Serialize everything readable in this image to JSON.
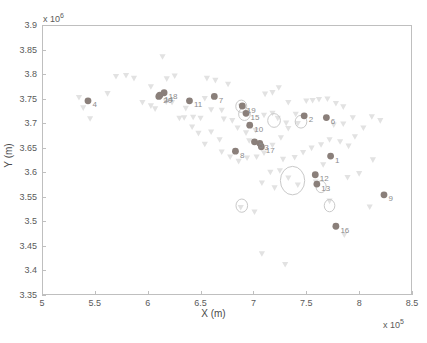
{
  "chart_data": {
    "type": "scatter",
    "title": "",
    "xlabel": "X (m)",
    "ylabel": "Y (m)",
    "x_exponent": "x 10",
    "x_exponent_power": "5",
    "y_exponent": "x 10",
    "y_exponent_power": "6",
    "xlim": [
      5.0,
      8.5
    ],
    "ylim": [
      3.35,
      3.9
    ],
    "xticks": [
      "5",
      "5.5",
      "6",
      "6.5",
      "7",
      "7.5",
      "8",
      "8.5"
    ],
    "xtick_values": [
      5.0,
      5.5,
      6.0,
      6.5,
      7.0,
      7.5,
      8.0,
      8.5
    ],
    "yticks": [
      "3.9",
      "3.85",
      "3.8",
      "3.75",
      "3.7",
      "3.65",
      "3.6",
      "3.55",
      "3.5",
      "3.45",
      "3.4",
      "3.35"
    ],
    "ytick_values": [
      3.9,
      3.85,
      3.8,
      3.75,
      3.7,
      3.65,
      3.6,
      3.55,
      3.5,
      3.45,
      3.4,
      3.35
    ],
    "grid": false,
    "legend": null,
    "colors": {
      "dark_marker": "#8a7f7a",
      "light_marker": "#e2e2e2",
      "ellipse_stroke": "#c9c9c9",
      "label_text": "#8c8c8c",
      "axis": "#bfbfbf"
    },
    "series": [
      {
        "name": "labeled-sites",
        "marker": "circle-filled",
        "color": "#8a7f7a",
        "points": [
          {
            "label": "4",
            "x": 5.435,
            "y": 3.7455
          },
          {
            "label": "14",
            "x": 6.115,
            "y": 3.757
          },
          {
            "label": "18",
            "x": 6.155,
            "y": 3.762
          },
          {
            "label": "11",
            "x": 6.395,
            "y": 3.7455
          },
          {
            "label": "7",
            "x": 6.63,
            "y": 3.7545
          },
          {
            "label": "19",
            "x": 6.895,
            "y": 3.735
          },
          {
            "label": "15",
            "x": 6.93,
            "y": 3.72
          },
          {
            "label": "10",
            "x": 6.965,
            "y": 3.696
          },
          {
            "label": "5",
            "x": 7.01,
            "y": 3.662
          },
          {
            "label": "3",
            "x": 7.06,
            "y": 3.659
          },
          {
            "label": "17",
            "x": 7.075,
            "y": 3.652
          },
          {
            "label": "8",
            "x": 6.83,
            "y": 3.643
          },
          {
            "label": "2",
            "x": 7.48,
            "y": 3.715
          },
          {
            "label": "6",
            "x": 7.69,
            "y": 3.7115
          },
          {
            "label": "12",
            "x": 7.585,
            "y": 3.595
          },
          {
            "label": "13",
            "x": 7.6,
            "y": 3.576
          },
          {
            "label": "16",
            "x": 7.78,
            "y": 3.49
          },
          {
            "label": "9",
            "x": 8.235,
            "y": 3.554
          },
          {
            "label": "1",
            "x": 7.73,
            "y": 3.633
          },
          {
            "label": "20",
            "x": 6.105,
            "y": 3.7545
          }
        ]
      },
      {
        "name": "background-stations",
        "marker": "triangle-down",
        "color": "#e2e2e2",
        "points": [
          {
            "x": 5.35,
            "y": 3.752
          },
          {
            "x": 5.39,
            "y": 3.731
          },
          {
            "x": 5.455,
            "y": 3.709
          },
          {
            "x": 5.7,
            "y": 3.795
          },
          {
            "x": 5.795,
            "y": 3.797
          },
          {
            "x": 5.87,
            "y": 3.791
          },
          {
            "x": 5.95,
            "y": 3.742
          },
          {
            "x": 6.03,
            "y": 3.735
          },
          {
            "x": 6.07,
            "y": 3.729
          },
          {
            "x": 6.14,
            "y": 3.835
          },
          {
            "x": 6.18,
            "y": 3.79
          },
          {
            "x": 6.255,
            "y": 3.796
          },
          {
            "x": 6.175,
            "y": 3.743
          },
          {
            "x": 6.23,
            "y": 3.742
          },
          {
            "x": 6.3,
            "y": 3.71
          },
          {
            "x": 6.345,
            "y": 3.711
          },
          {
            "x": 6.43,
            "y": 3.712
          },
          {
            "x": 6.5,
            "y": 3.71
          },
          {
            "x": 6.56,
            "y": 3.791
          },
          {
            "x": 6.64,
            "y": 3.787
          },
          {
            "x": 6.54,
            "y": 3.75
          },
          {
            "x": 6.6,
            "y": 3.727
          },
          {
            "x": 6.7,
            "y": 3.726
          },
          {
            "x": 6.76,
            "y": 3.779
          },
          {
            "x": 6.72,
            "y": 3.708
          },
          {
            "x": 6.8,
            "y": 3.705
          },
          {
            "x": 6.88,
            "y": 3.734
          },
          {
            "x": 6.925,
            "y": 3.719
          },
          {
            "x": 6.85,
            "y": 3.69
          },
          {
            "x": 6.93,
            "y": 3.68
          },
          {
            "x": 6.6,
            "y": 3.682
          },
          {
            "x": 6.68,
            "y": 3.666
          },
          {
            "x": 6.54,
            "y": 3.657
          },
          {
            "x": 6.48,
            "y": 3.679
          },
          {
            "x": 6.96,
            "y": 3.664
          },
          {
            "x": 7.02,
            "y": 3.685
          },
          {
            "x": 7.1,
            "y": 3.716
          },
          {
            "x": 7.18,
            "y": 3.72
          },
          {
            "x": 7.11,
            "y": 3.759
          },
          {
            "x": 7.18,
            "y": 3.762
          },
          {
            "x": 7.24,
            "y": 3.772
          },
          {
            "x": 7.33,
            "y": 3.742
          },
          {
            "x": 7.23,
            "y": 3.71
          },
          {
            "x": 7.31,
            "y": 3.7
          },
          {
            "x": 7.42,
            "y": 3.699
          },
          {
            "x": 7.5,
            "y": 3.745
          },
          {
            "x": 7.56,
            "y": 3.746
          },
          {
            "x": 7.62,
            "y": 3.748
          },
          {
            "x": 7.7,
            "y": 3.749
          },
          {
            "x": 7.78,
            "y": 3.74
          },
          {
            "x": 7.85,
            "y": 3.733
          },
          {
            "x": 7.94,
            "y": 3.711
          },
          {
            "x": 7.85,
            "y": 3.698
          },
          {
            "x": 7.76,
            "y": 3.696
          },
          {
            "x": 7.4,
            "y": 3.718
          },
          {
            "x": 7.33,
            "y": 3.689
          },
          {
            "x": 7.26,
            "y": 3.67
          },
          {
            "x": 7.18,
            "y": 3.655
          },
          {
            "x": 7.1,
            "y": 3.639
          },
          {
            "x": 7.03,
            "y": 3.631
          },
          {
            "x": 6.94,
            "y": 3.629
          },
          {
            "x": 6.86,
            "y": 3.622
          },
          {
            "x": 6.78,
            "y": 3.631
          },
          {
            "x": 6.7,
            "y": 3.641
          },
          {
            "x": 7.28,
            "y": 3.626
          },
          {
            "x": 7.39,
            "y": 3.63
          },
          {
            "x": 7.47,
            "y": 3.64
          },
          {
            "x": 7.55,
            "y": 3.649
          },
          {
            "x": 7.64,
            "y": 3.656
          },
          {
            "x": 7.72,
            "y": 3.666
          },
          {
            "x": 7.82,
            "y": 3.662
          },
          {
            "x": 7.9,
            "y": 3.653
          },
          {
            "x": 7.96,
            "y": 3.672
          },
          {
            "x": 8.04,
            "y": 3.69
          },
          {
            "x": 8.12,
            "y": 3.713
          },
          {
            "x": 8.2,
            "y": 3.705
          },
          {
            "x": 7.33,
            "y": 3.588
          },
          {
            "x": 7.42,
            "y": 3.574
          },
          {
            "x": 7.2,
            "y": 3.568
          },
          {
            "x": 7.08,
            "y": 3.578
          },
          {
            "x": 7.16,
            "y": 3.6
          },
          {
            "x": 7.25,
            "y": 3.603
          },
          {
            "x": 6.88,
            "y": 3.528
          },
          {
            "x": 7.01,
            "y": 3.519
          },
          {
            "x": 7.59,
            "y": 3.58
          },
          {
            "x": 7.72,
            "y": 3.541
          },
          {
            "x": 7.66,
            "y": 3.615
          },
          {
            "x": 7.89,
            "y": 3.589
          },
          {
            "x": 8.0,
            "y": 3.597
          },
          {
            "x": 8.13,
            "y": 3.625
          },
          {
            "x": 7.08,
            "y": 3.434
          },
          {
            "x": 7.3,
            "y": 3.412
          },
          {
            "x": 7.86,
            "y": 3.472
          },
          {
            "x": 8.1,
            "y": 3.529
          },
          {
            "x": 6.42,
            "y": 3.692
          },
          {
            "x": 6.36,
            "y": 3.73
          },
          {
            "x": 5.62,
            "y": 3.76
          },
          {
            "x": 6.03,
            "y": 3.774
          }
        ]
      }
    ],
    "ellipses": [
      {
        "cx": 6.885,
        "cy": 3.7345,
        "rx": 0.052,
        "ry": 0.0125
      },
      {
        "cx": 6.915,
        "cy": 3.7185,
        "rx": 0.055,
        "ry": 0.013
      },
      {
        "cx": 7.195,
        "cy": 3.7055,
        "rx": 0.06,
        "ry": 0.014
      },
      {
        "cx": 7.45,
        "cy": 3.703,
        "rx": 0.055,
        "ry": 0.013
      },
      {
        "cx": 6.89,
        "cy": 3.532,
        "rx": 0.055,
        "ry": 0.0135
      },
      {
        "cx": 7.37,
        "cy": 3.583,
        "rx": 0.115,
        "ry": 0.029
      },
      {
        "cx": 7.64,
        "cy": 3.5705,
        "rx": 0.048,
        "ry": 0.012
      },
      {
        "cx": 7.72,
        "cy": 3.532,
        "rx": 0.05,
        "ry": 0.0125
      }
    ]
  },
  "caption": {
    "text": ""
  }
}
